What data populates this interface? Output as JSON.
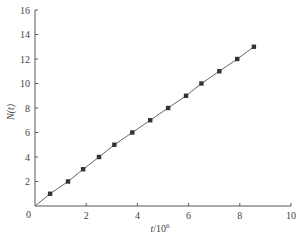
{
  "chart_data": {
    "type": "line",
    "title": "",
    "xlabel": "t/10^6",
    "xlabel_main": "t",
    "xlabel_suffix": "/10",
    "xlabel_exp": "6",
    "ylabel": "N(t)",
    "xlim": [
      0,
      10
    ],
    "ylim": [
      0,
      16
    ],
    "xticks": [
      2,
      4,
      6,
      8,
      10
    ],
    "yticks": [
      2,
      4,
      6,
      8,
      10,
      12,
      14,
      16
    ],
    "origin_label": "0",
    "grid": false,
    "legend": null,
    "series": [
      {
        "name": "N(t)",
        "marker": "square",
        "line": "solid",
        "color": "#333333",
        "x": [
          0,
          0.59,
          1.29,
          1.88,
          2.5,
          3.1,
          3.8,
          4.5,
          5.2,
          5.9,
          6.5,
          7.2,
          7.9,
          8.55
        ],
        "y": [
          0,
          1,
          2,
          3,
          4,
          5,
          6,
          7,
          8,
          9,
          10,
          11,
          12,
          13
        ]
      }
    ]
  }
}
